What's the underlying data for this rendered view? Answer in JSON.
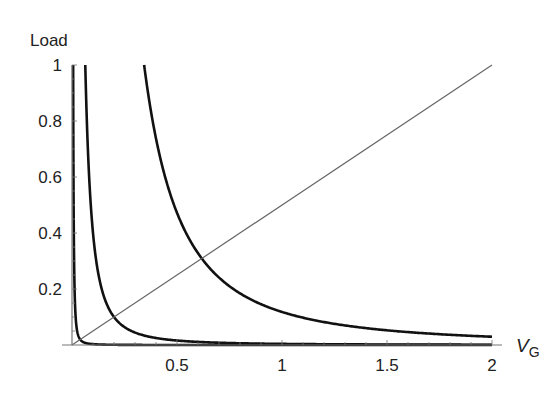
{
  "chart_data": {
    "type": "line",
    "title": "",
    "xlabel": "V",
    "xlabel_subscript": "G",
    "ylabel": "Load",
    "xlim": [
      0,
      2
    ],
    "ylim": [
      0,
      1
    ],
    "grid": false,
    "legend": null,
    "x_ticks": [
      {
        "value": 0.5,
        "label": "0.5"
      },
      {
        "value": 1,
        "label": "1"
      },
      {
        "value": 1.5,
        "label": "1.5"
      },
      {
        "value": 2,
        "label": "2"
      }
    ],
    "y_ticks": [
      {
        "value": 0.2,
        "label": "0.2"
      },
      {
        "value": 0.4,
        "label": "0.4"
      },
      {
        "value": 0.6,
        "label": "0.6"
      },
      {
        "value": 0.8,
        "label": "0.8"
      },
      {
        "value": 1,
        "label": "1"
      }
    ],
    "series": [
      {
        "name": "curve-1",
        "form": "k / V^2",
        "k": 3e-05,
        "color": "#111111",
        "width": 2.6
      },
      {
        "name": "curve-2",
        "form": "k / V^2",
        "k": 0.004,
        "color": "#111111",
        "width": 2.6
      },
      {
        "name": "curve-3",
        "form": "k / V^2",
        "k": 0.118,
        "color": "#111111",
        "width": 2.6
      },
      {
        "name": "load-line",
        "form": "V / 2",
        "color": "#666666",
        "width": 1.2,
        "x": [
          0,
          2
        ],
        "y": [
          0,
          1
        ]
      }
    ],
    "annotations": [
      {
        "text": "curve-3 crosses load-line",
        "x": 0.62,
        "y": 0.31
      },
      {
        "text": "curve-2 crosses load-line",
        "x": 0.2,
        "y": 0.1
      }
    ]
  }
}
